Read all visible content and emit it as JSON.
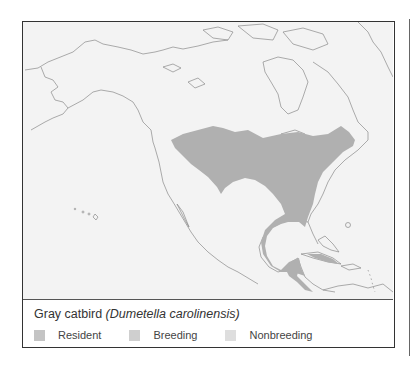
{
  "figure": {
    "species_common": "Gray catbird",
    "species_scientific": "(Dumetella carolinensis)",
    "map_region": "North America",
    "range_color": "#b0b0b0",
    "land_color": "#f3f3f3",
    "coast_color": "#8a8a8a"
  },
  "legend": {
    "items": [
      {
        "label": "Resident",
        "color": "#c4c4c4"
      },
      {
        "label": "Breeding",
        "color": "#cfcfcf"
      },
      {
        "label": "Nonbreeding",
        "color": "#dedede"
      }
    ]
  }
}
